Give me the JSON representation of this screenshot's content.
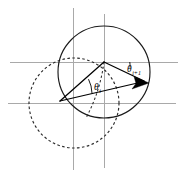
{
  "figure": {
    "background_color": "#ffffff",
    "width": 185,
    "height": 176
  },
  "labels": {
    "angle_lower": {
      "symbol": "θ",
      "subscript": "i",
      "full": "θi",
      "x": 94,
      "y": 90
    },
    "angle_upper": {
      "symbol": "θ",
      "subscript": "i+1",
      "full": "θi+1",
      "x": 127,
      "y": 72
    }
  },
  "colors": {
    "axis": "#a9a9a9",
    "stroke": "#1a1a1a",
    "dashed": "#2b2b2b",
    "vector": "#000000"
  },
  "geometry": {
    "axes": {
      "vertical": [
        {
          "name": "v-axis-left",
          "x": 73,
          "y1": 8,
          "y2": 170
        },
        {
          "name": "v-axis-right",
          "x": 104,
          "y1": 14,
          "y2": 168
        }
      ],
      "horizontal": [
        {
          "name": "h-axis-upper",
          "y": 62,
          "x1": 10,
          "x2": 178
        },
        {
          "name": "h-axis-lower",
          "y": 103,
          "x1": 8,
          "x2": 176
        }
      ]
    },
    "circle_solid": {
      "cx": 104,
      "cy": 72,
      "r": 46
    },
    "circle_dashed": {
      "cx": 74,
      "cy": 103,
      "r": 45
    },
    "vertex_origin": {
      "x": 104,
      "y": 62
    },
    "vertex_tail": {
      "x": 60,
      "y": 101
    },
    "arrow_tip": {
      "x": 148,
      "y": 83
    },
    "arc_lower": {
      "cx": 60,
      "cy": 101,
      "r": 33
    },
    "arc_upper": {
      "cx": 104,
      "cy": 62,
      "r": 26
    }
  }
}
